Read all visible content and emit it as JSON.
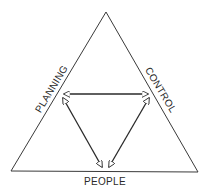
{
  "diagram": {
    "type": "triangle-relationship",
    "outer_triangle": {
      "stroke": "#3a3a3a"
    },
    "labels": {
      "left_side": "PLANNING",
      "right_side": "CONTROL",
      "bottom_side": "PEOPLE"
    },
    "arrows": [
      {
        "from": "PLANNING",
        "to": "CONTROL",
        "bidirectional": true
      },
      {
        "from": "PLANNING",
        "to": "PEOPLE",
        "bidirectional": true
      },
      {
        "from": "CONTROL",
        "to": "PEOPLE",
        "bidirectional": true
      }
    ],
    "colors": {
      "line": "#2a2a2a",
      "background": "#ffffff"
    }
  }
}
